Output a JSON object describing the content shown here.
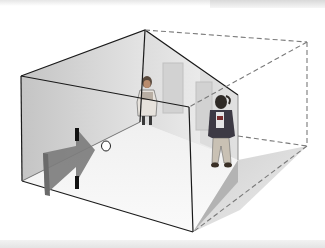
{
  "figure": {
    "elements": [
      "room-shell",
      "back-left-wall",
      "back-right-wall",
      "floor",
      "dashed-apparent-room-outline",
      "viewer-arrow",
      "peephole",
      "small-appearing-person",
      "large-appearing-person",
      "window-left",
      "window-right"
    ]
  },
  "colors": {
    "edge": "#1a1a1a",
    "dashed_edge": "#7a7a7a",
    "wall_shade": "#c9c9c9",
    "wall_light": "#ececec",
    "floor": "#f4f4f4",
    "arrow": "#7d7d7d",
    "shadow": "#bdbdbd"
  }
}
